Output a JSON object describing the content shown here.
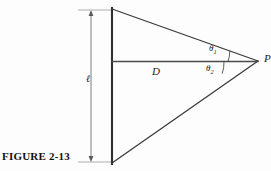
{
  "figure": {
    "caption": "FIGURE 2-13",
    "type": "geometric-diagram",
    "background_color": "#fdfdfd",
    "line_color": "#2a2a2a"
  },
  "labels": {
    "distance_horizontal": "D",
    "length_vertical": "ℓ",
    "apex_point": "P",
    "angle_upper": "θ",
    "angle_upper_subscript": "1",
    "angle_lower": "θ",
    "angle_lower_subscript": "2"
  },
  "geometry": {
    "vertical_edge_x": 112,
    "vertical_edge_top_y": 9,
    "vertical_edge_bottom_y": 163,
    "apex_x": 258,
    "apex_y": 61,
    "horizontal_line_start_x": 112,
    "horizontal_line_y": 61,
    "dimension_line_x": 91,
    "dimension_top_y": 11,
    "dimension_bottom_y": 161
  }
}
